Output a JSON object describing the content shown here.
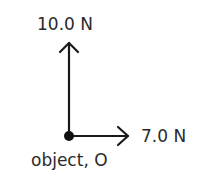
{
  "diagram": {
    "type": "force-diagram",
    "forces": [
      {
        "label": "10.0 N",
        "direction": "up",
        "magnitude": 10.0,
        "unit": "N"
      },
      {
        "label": "7.0 N",
        "direction": "right",
        "magnitude": 7.0,
        "unit": "N"
      }
    ],
    "object_label": "object, O",
    "colors": {
      "line": "#1a1a1a",
      "text": "#2a2a2a"
    }
  }
}
